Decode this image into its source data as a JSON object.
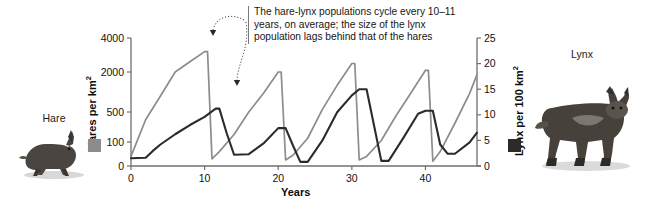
{
  "figure": {
    "annotation": "The hare-lynx populations cycle every 10–11 years, on average; the size of the lynx population lags behind that of the hares",
    "hare_caption": "Hare",
    "lynx_caption": "Lynx",
    "hare_color": "#8c8c8c",
    "lynx_color": "#2b2b2b",
    "axis_color": "#6f6f6f"
  },
  "chart_data": {
    "type": "line",
    "title": "",
    "xlabel": "Years",
    "ylabel": "Hares per km²",
    "y2label": "Lynx per 100 km²",
    "grid": false,
    "legend": [
      "Hare",
      "Lynx"
    ],
    "xlim": [
      0,
      47
    ],
    "xticks": [
      0,
      10,
      20,
      30,
      40
    ],
    "xticklabels": [
      "0",
      "10",
      "20",
      "30",
      "40"
    ],
    "yticks": [
      0,
      100,
      500,
      2000,
      4000
    ],
    "yticklabels": [
      "0",
      "100",
      "500",
      "2000",
      "4000"
    ],
    "y2ticks": [
      0,
      5,
      10,
      15,
      20,
      25
    ],
    "y2ticklabels": [
      "0",
      "5",
      "10",
      "15",
      "20",
      "25"
    ],
    "y_scale": "compressed-log-like",
    "series": [
      {
        "name": "Hare",
        "axis": "left",
        "units": "hares per km²",
        "color": "#8c8c8c",
        "x": [
          0,
          2,
          4,
          6,
          8,
          10,
          10.4,
          11,
          12,
          14,
          16,
          18,
          20,
          20.4,
          21,
          22,
          24,
          26,
          28,
          30,
          30.4,
          31,
          32,
          34,
          36,
          38,
          40,
          40.4,
          41,
          42,
          44,
          46,
          47
        ],
        "y": [
          40,
          400,
          1100,
          2000,
          2600,
          3200,
          3200,
          30,
          60,
          200,
          500,
          1200,
          2000,
          2000,
          25,
          45,
          150,
          600,
          1500,
          2500,
          2500,
          25,
          40,
          120,
          450,
          1200,
          2100,
          2100,
          20,
          60,
          350,
          1200,
          1900
        ]
      },
      {
        "name": "Lynx",
        "axis": "right",
        "units": "lynx per 100 km²",
        "color": "#2b2b2b",
        "x": [
          0,
          2,
          3,
          4,
          6,
          8,
          10,
          11.5,
          12,
          13,
          14,
          16,
          18,
          20,
          21,
          22,
          23,
          24,
          26,
          28,
          30,
          31,
          32,
          33,
          34,
          35,
          37,
          39,
          40,
          41,
          42,
          43,
          44,
          46,
          47
        ],
        "y": [
          1.5,
          1.6,
          3.0,
          4.2,
          6.2,
          8.0,
          9.6,
          11.2,
          11.2,
          6.4,
          2.2,
          2.3,
          4.4,
          7.4,
          7.4,
          4.0,
          0.8,
          0.8,
          5.0,
          10.5,
          13.8,
          15.0,
          15.0,
          8.0,
          1.0,
          1.0,
          5.5,
          10.2,
          10.8,
          10.8,
          4.2,
          2.4,
          2.4,
          4.6,
          6.5
        ]
      }
    ],
    "annotations": [
      {
        "text": "The hare-lynx populations cycle every 10–11 years, on average; the size of the lynx population lags behind that of the hares",
        "points_to": [
          "hare peak at year 10",
          "lynx peak at year 11.5"
        ]
      }
    ]
  }
}
